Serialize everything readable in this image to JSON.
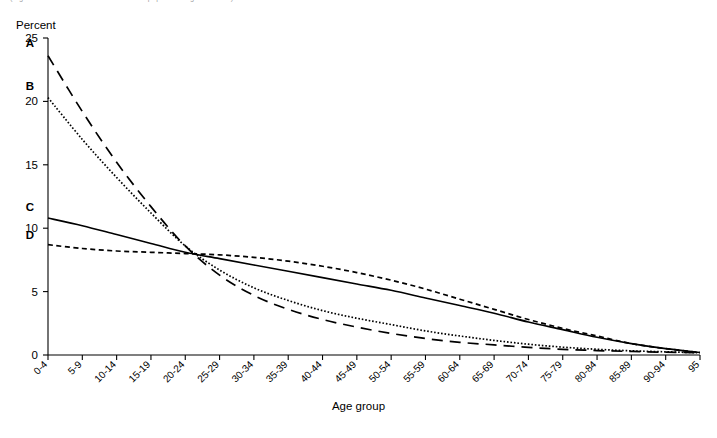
{
  "header": {
    "clipped_note": "(Figures based on estimates of resident population aged 0 – 95+)"
  },
  "axis_titles": {
    "y": "Percent",
    "x": "Age group"
  },
  "chart_data": {
    "type": "line",
    "title": "",
    "subtitle": "",
    "xlabel": "Age group",
    "ylabel": "Percent",
    "ylim": [
      0,
      25
    ],
    "yticks": [
      0,
      5,
      10,
      15,
      20,
      25
    ],
    "grid": false,
    "legend_position": "inline-left-labels",
    "categories": [
      "0-4",
      "5-9",
      "10-14",
      "15-19",
      "20-24",
      "25-29",
      "30-34",
      "35-39",
      "40-44",
      "45-49",
      "50-54",
      "55-59",
      "60-64",
      "65-69",
      "70-74",
      "75-79",
      "80-84",
      "85-89",
      "90-94",
      "95"
    ],
    "series": [
      {
        "name": "A",
        "style": "long-dash",
        "values": [
          23.6,
          19.2,
          15.2,
          11.7,
          8.6,
          6.3,
          4.7,
          3.6,
          2.8,
          2.2,
          1.7,
          1.3,
          1.0,
          0.8,
          0.6,
          0.45,
          0.35,
          0.28,
          0.22,
          0.18
        ]
      },
      {
        "name": "B",
        "style": "dotted",
        "values": [
          20.3,
          17.0,
          14.0,
          11.2,
          8.6,
          6.7,
          5.3,
          4.3,
          3.5,
          2.9,
          2.4,
          1.9,
          1.5,
          1.15,
          0.85,
          0.62,
          0.45,
          0.33,
          0.25,
          0.18
        ]
      },
      {
        "name": "C",
        "style": "solid",
        "values": [
          10.8,
          10.2,
          9.5,
          8.8,
          8.1,
          7.6,
          7.1,
          6.6,
          6.1,
          5.6,
          5.1,
          4.5,
          3.9,
          3.3,
          2.6,
          2.0,
          1.4,
          0.9,
          0.5,
          0.2
        ]
      },
      {
        "name": "D",
        "style": "medium-dash",
        "values": [
          8.7,
          8.4,
          8.2,
          8.1,
          8.0,
          7.9,
          7.7,
          7.4,
          7.0,
          6.5,
          5.9,
          5.2,
          4.4,
          3.6,
          2.8,
          2.1,
          1.5,
          0.9,
          0.5,
          0.2
        ]
      }
    ],
    "curve_labels": [
      {
        "name": "A",
        "text": "A"
      },
      {
        "name": "B",
        "text": "B"
      },
      {
        "name": "C",
        "text": "C"
      },
      {
        "name": "D",
        "text": "D"
      }
    ]
  }
}
